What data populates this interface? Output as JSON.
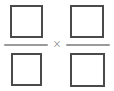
{
  "document": {
    "type": "math-expression",
    "description": "Fraction multiplication template with four empty answer boxes",
    "background_color": "#ffffff"
  },
  "expression": {
    "operator_symbol": "×",
    "operator_name": "multiplication-sign",
    "operands": [
      {
        "name": "left-fraction",
        "numerator": {
          "value": "",
          "placeholder": ""
        },
        "denominator": {
          "value": "",
          "placeholder": ""
        }
      },
      {
        "name": "right-fraction",
        "numerator": {
          "value": "",
          "placeholder": ""
        },
        "denominator": {
          "value": "",
          "placeholder": ""
        }
      }
    ]
  },
  "style": {
    "box_border_color": "#4a4a4a",
    "box_fill_color": "#ffffff",
    "bar_color": "#9a9a9a",
    "operator_color": "#8c8c8c"
  }
}
